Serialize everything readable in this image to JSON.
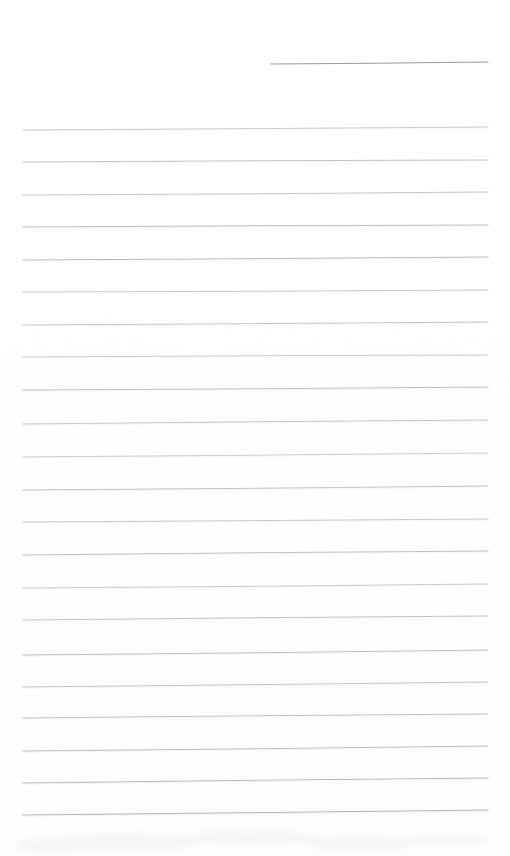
{
  "document": {
    "kind": "scanned-blank-lined-paper",
    "title": "Blank Lined Notebook Page",
    "page_width": 510,
    "page_height": 856,
    "background_color": "#fefefe",
    "content_text": "",
    "has_handwriting": false,
    "has_printed_text": false
  },
  "ruling": {
    "line_color": "#a9a9ae",
    "line_color_dark": "#8d8d94",
    "line_thickness": 1,
    "left_margin_x": 23,
    "right_margin_x": 488,
    "first_line_y": 130,
    "line_spacing": 32.4,
    "full_line_count": 22,
    "full_lines": [
      {
        "index": 1,
        "y_left": 130,
        "y_right": 127,
        "opacity": 0.62
      },
      {
        "index": 2,
        "y_left": 162,
        "y_right": 160,
        "opacity": 0.7
      },
      {
        "index": 3,
        "y_left": 195,
        "y_right": 192,
        "opacity": 0.66
      },
      {
        "index": 4,
        "y_left": 227,
        "y_right": 225,
        "opacity": 0.74
      },
      {
        "index": 5,
        "y_left": 260,
        "y_right": 257,
        "opacity": 0.8
      },
      {
        "index": 6,
        "y_left": 292,
        "y_right": 290,
        "opacity": 0.64
      },
      {
        "index": 7,
        "y_left": 325,
        "y_right": 322,
        "opacity": 0.68
      },
      {
        "index": 8,
        "y_left": 357,
        "y_right": 355,
        "opacity": 0.6
      },
      {
        "index": 9,
        "y_left": 390,
        "y_right": 387,
        "opacity": 0.72
      },
      {
        "index": 10,
        "y_left": 424,
        "y_right": 420,
        "opacity": 0.66
      },
      {
        "index": 11,
        "y_left": 457,
        "y_right": 453,
        "opacity": 0.58
      },
      {
        "index": 12,
        "y_left": 490,
        "y_right": 486,
        "opacity": 0.7
      },
      {
        "index": 13,
        "y_left": 522,
        "y_right": 519,
        "opacity": 0.64
      },
      {
        "index": 14,
        "y_left": 555,
        "y_right": 551,
        "opacity": 0.72
      },
      {
        "index": 15,
        "y_left": 588,
        "y_right": 584,
        "opacity": 0.62
      },
      {
        "index": 16,
        "y_left": 620,
        "y_right": 616,
        "opacity": 0.68
      },
      {
        "index": 17,
        "y_left": 622,
        "y_right": 619,
        "opacity": 0.0
      },
      {
        "index": 18,
        "y_left": 655,
        "y_right": 650,
        "opacity": 0.74
      },
      {
        "index": 19,
        "y_left": 687,
        "y_right": 682,
        "opacity": 0.66
      },
      {
        "index": 20,
        "y_left": 718,
        "y_right": 714,
        "opacity": 0.7
      },
      {
        "index": 21,
        "y_left": 751,
        "y_right": 746,
        "opacity": 0.78
      },
      {
        "index": 22,
        "y_left": 783,
        "y_right": 778,
        "opacity": 0.8
      },
      {
        "index": 23,
        "y_left": 815,
        "y_right": 810,
        "opacity": 0.85
      }
    ]
  },
  "header_rule": {
    "name": "short-header-line",
    "start_x": 271,
    "end_x": 488,
    "y_left": 64,
    "y_right": 62,
    "color": "#8d8d94",
    "opacity": 0.9
  },
  "smudge": {
    "present": true,
    "color": "#f2f2f4",
    "region_top_y": 822,
    "region_height": 34
  }
}
